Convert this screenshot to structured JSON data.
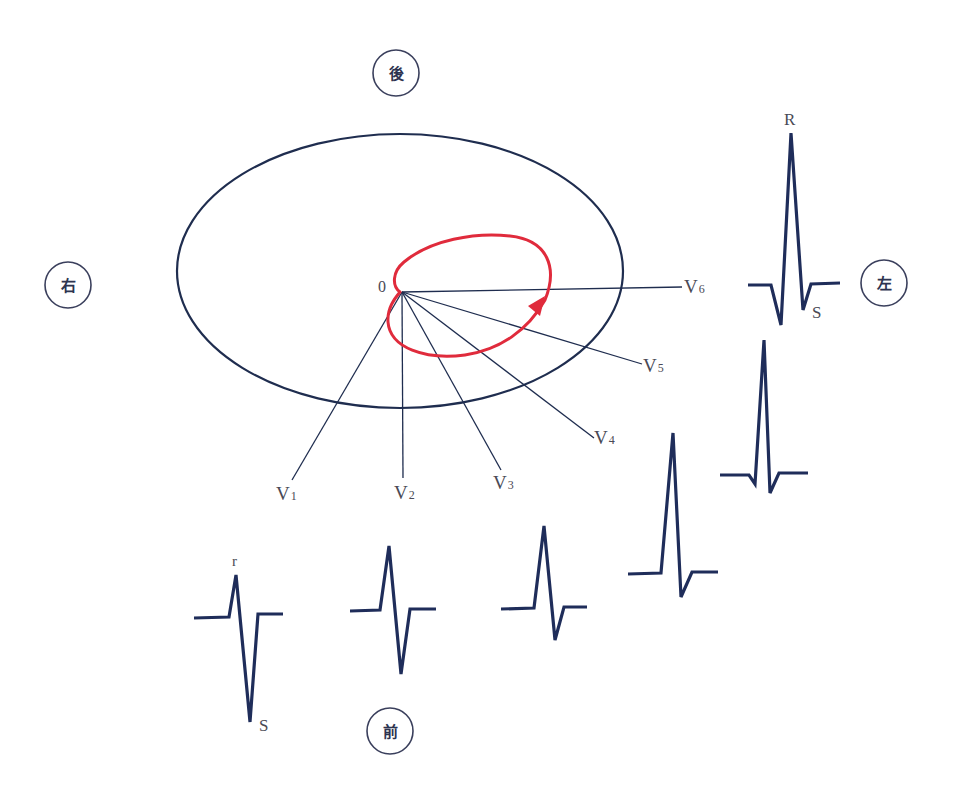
{
  "diagram": {
    "title": "",
    "colors": {
      "outline": "#1f2d4f",
      "vector_loop": "#e02b3c",
      "qrs_trace": "#1f2d5a",
      "direction_circle": "#3a3f5c"
    },
    "directions": {
      "posterior": "後",
      "anterior": "前",
      "right": "右",
      "left": "左"
    },
    "origin_label": "0",
    "leads": [
      {
        "id": "V1",
        "main": "V",
        "sub": "1"
      },
      {
        "id": "V2",
        "main": "V",
        "sub": "2"
      },
      {
        "id": "V3",
        "main": "V",
        "sub": "3"
      },
      {
        "id": "V4",
        "main": "V",
        "sub": "4"
      },
      {
        "id": "V5",
        "main": "V",
        "sub": "5"
      },
      {
        "id": "V6",
        "main": "V",
        "sub": "6"
      }
    ],
    "waveform_labels": {
      "v1_r": "r",
      "v1_s": "S",
      "v6_r": "R",
      "v6_s": "S"
    },
    "loop": {
      "description": "QRS vector loop in horizontal plane, counterclockwise, arrow pointing toward left",
      "arrow_direction": "counterclockwise"
    },
    "complexes": [
      {
        "lead": "V1",
        "pattern": "rS",
        "r_amplitude": "small",
        "s_amplitude": "deep"
      },
      {
        "lead": "V2",
        "pattern": "RS",
        "r_amplitude": "medium",
        "s_amplitude": "medium"
      },
      {
        "lead": "V3",
        "pattern": "RS",
        "r_amplitude": "medium",
        "s_amplitude": "medium-small"
      },
      {
        "lead": "V4",
        "pattern": "Rs",
        "r_amplitude": "tall",
        "s_amplitude": "small"
      },
      {
        "lead": "V5",
        "pattern": "qRs",
        "r_amplitude": "tall",
        "s_amplitude": "small"
      },
      {
        "lead": "V6",
        "pattern": "qRS",
        "r_amplitude": "tallest",
        "s_amplitude": "small"
      }
    ]
  }
}
